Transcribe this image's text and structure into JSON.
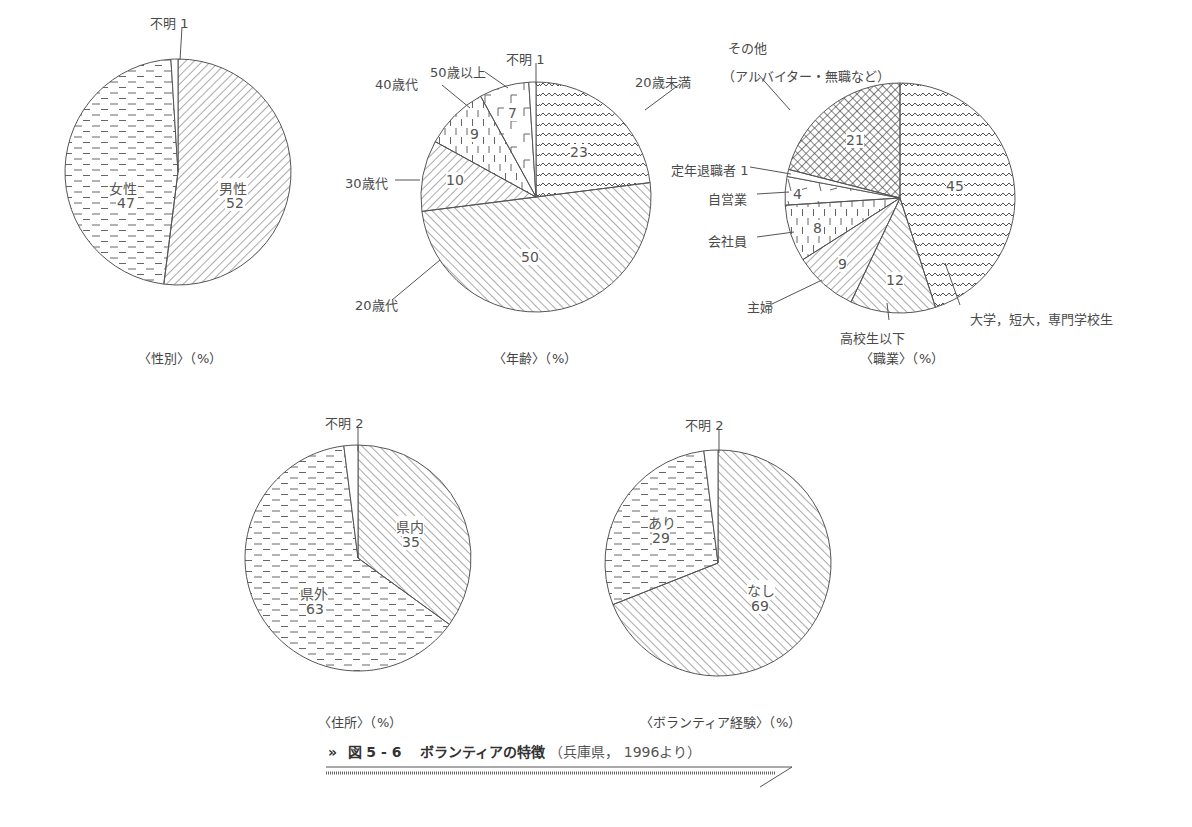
{
  "figure": {
    "marker": "»",
    "number": "図 5 - 6",
    "title": "ボランティアの特徴",
    "source": "（兵庫県， 1996より）"
  },
  "chart_data": [
    {
      "type": "pie",
      "title": "〈性別〉（%）",
      "unit": "%",
      "start": "12 o'clock, clockwise",
      "slices": [
        {
          "label": "男性",
          "value": 52,
          "pattern": "diag-right"
        },
        {
          "label": "女性",
          "value": 47,
          "pattern": "h-dash"
        },
        {
          "label": "不明",
          "value": 1,
          "pattern": "none"
        }
      ]
    },
    {
      "type": "pie",
      "title": "〈年齢〉（%）",
      "unit": "%",
      "start": "12 o'clock, clockwise",
      "slices": [
        {
          "label": "20歳未満",
          "value": 23,
          "pattern": "wave"
        },
        {
          "label": "20歳代",
          "value": 50,
          "pattern": "diag-left"
        },
        {
          "label": "30歳代",
          "value": 10,
          "pattern": "diag-right"
        },
        {
          "label": "40歳代",
          "value": 9,
          "pattern": "v-dash"
        },
        {
          "label": "50歳以上",
          "value": 7,
          "pattern": "bracket"
        },
        {
          "label": "不明",
          "value": 1,
          "pattern": "none"
        }
      ]
    },
    {
      "type": "pie",
      "title": "〈職業〉（%）",
      "unit": "%",
      "start": "12 o'clock, clockwise",
      "slices": [
        {
          "label": "大学，短大，専門学校生",
          "value": 45,
          "pattern": "wave"
        },
        {
          "label": "高校生以下",
          "value": 12,
          "pattern": "diag-left"
        },
        {
          "label": "主婦",
          "value": 9,
          "pattern": "diag-right"
        },
        {
          "label": "会社員",
          "value": 8,
          "pattern": "v-dash"
        },
        {
          "label": "自営業",
          "value": 4,
          "pattern": "sparse"
        },
        {
          "label": "定年退職者",
          "value": 1,
          "pattern": "none"
        },
        {
          "label": "その他（アルバイター・無職など）",
          "value": 21,
          "pattern": "crosshatch"
        }
      ]
    },
    {
      "type": "pie",
      "title": "〈住所〉（%）",
      "unit": "%",
      "start": "12 o'clock, clockwise",
      "slices": [
        {
          "label": "県内",
          "value": 35,
          "pattern": "diag-left"
        },
        {
          "label": "県外",
          "value": 63,
          "pattern": "h-dash"
        },
        {
          "label": "不明",
          "value": 2,
          "pattern": "none"
        }
      ]
    },
    {
      "type": "pie",
      "title": "〈ボランティア経験〉（%）",
      "unit": "%",
      "start": "12 o'clock, clockwise",
      "slices": [
        {
          "label": "なし",
          "value": 69,
          "pattern": "diag-left"
        },
        {
          "label": "あり",
          "value": 29,
          "pattern": "h-dash"
        },
        {
          "label": "不明",
          "value": 2,
          "pattern": "none"
        }
      ]
    }
  ],
  "labels": {
    "gender": {
      "unknown": "不明 1",
      "male": "男性",
      "male_v": "52",
      "female": "女性",
      "female_v": "47",
      "caption": "〈性別〉（%）"
    },
    "age": {
      "unknown": "不明 1",
      "over50": "50歳以上",
      "v50": "7",
      "forties": "40歳代",
      "v40": "9",
      "thirties": "30歳代",
      "v30": "10",
      "twenties": "20歳代",
      "v20": "50",
      "under20": "20歳未満",
      "vu20": "23",
      "caption": "〈年齢〉（%）"
    },
    "job": {
      "other1": "その他",
      "other2": "（アルバイター・無職など）",
      "v_other": "21",
      "retired": "定年退職者 1",
      "self": "自営業",
      "v_self": "4",
      "company": "会社員",
      "v_company": "8",
      "housewife": "主婦",
      "v_housewife": "9",
      "highschool": "高校生以下",
      "v_high": "12",
      "univ": "大学，短大，専門学校生",
      "v_univ": "45",
      "caption": "〈職業〉（%）"
    },
    "address": {
      "unknown": "不明 2",
      "inside": "県内",
      "v_inside": "35",
      "outside": "県外",
      "v_outside": "63",
      "caption": "〈住所〉（%）"
    },
    "exp": {
      "unknown": "不明 2",
      "yes": "あり",
      "v_yes": "29",
      "no": "なし",
      "v_no": "69",
      "caption": "〈ボランティア経験〉（%）"
    }
  }
}
